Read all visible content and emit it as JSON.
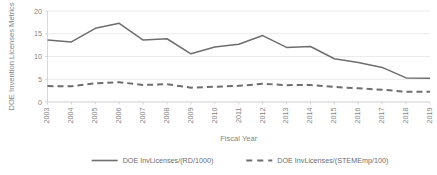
{
  "chart_data": {
    "type": "line",
    "title": "",
    "xlabel": "Fiscal Year",
    "ylabel": "DOE Invention Licenses Metrics",
    "ylim": [
      0,
      20
    ],
    "yticks": [
      0,
      5,
      10,
      15,
      20
    ],
    "grid": true,
    "legend_position": "bottom",
    "categories": [
      "2003",
      "2004",
      "2005",
      "2006",
      "2007",
      "2008",
      "2009",
      "2010",
      "2011",
      "2012",
      "2013",
      "2014",
      "2015",
      "2016",
      "2017",
      "2018",
      "2019"
    ],
    "series": [
      {
        "name": "DOE InvLicenses/(RD/1000)",
        "style": "solid",
        "color": "#6e6e6e",
        "values": [
          13.6,
          13.2,
          16.2,
          17.3,
          13.6,
          13.9,
          10.6,
          12.1,
          12.7,
          14.6,
          12.0,
          12.2,
          9.5,
          8.7,
          7.6,
          5.3,
          5.2
        ]
      },
      {
        "name": "DOE InvLicenses/(STEMEmp/100)",
        "style": "dashed",
        "color": "#6e6e6e",
        "values": [
          3.5,
          3.45,
          4.1,
          4.35,
          3.75,
          3.9,
          3.15,
          3.35,
          3.55,
          4.0,
          3.7,
          3.75,
          3.3,
          3.0,
          2.7,
          2.25,
          2.25
        ]
      }
    ]
  },
  "legend": {
    "items": [
      {
        "label": "DOE InvLicenses/(RD/1000)",
        "style": "solid"
      },
      {
        "label": "DOE InvLicenses/(STEMEmp/100)",
        "style": "dashed"
      }
    ]
  },
  "axes": {
    "y_title": "DOE Invention Licenses Metrics",
    "x_title": "Fiscal Year",
    "y_tick_labels": [
      "0",
      "5",
      "10",
      "15",
      "20"
    ],
    "x_tick_labels": [
      "2003",
      "2004",
      "2005",
      "2006",
      "2007",
      "2008",
      "2009",
      "2010",
      "2011",
      "2012",
      "2013",
      "2014",
      "2015",
      "2016",
      "2017",
      "2018",
      "2019"
    ]
  },
  "colors": {
    "series": "#6e6e6e",
    "grid": "#e2e2e2",
    "text": "#868686",
    "background": "#ffffff"
  }
}
